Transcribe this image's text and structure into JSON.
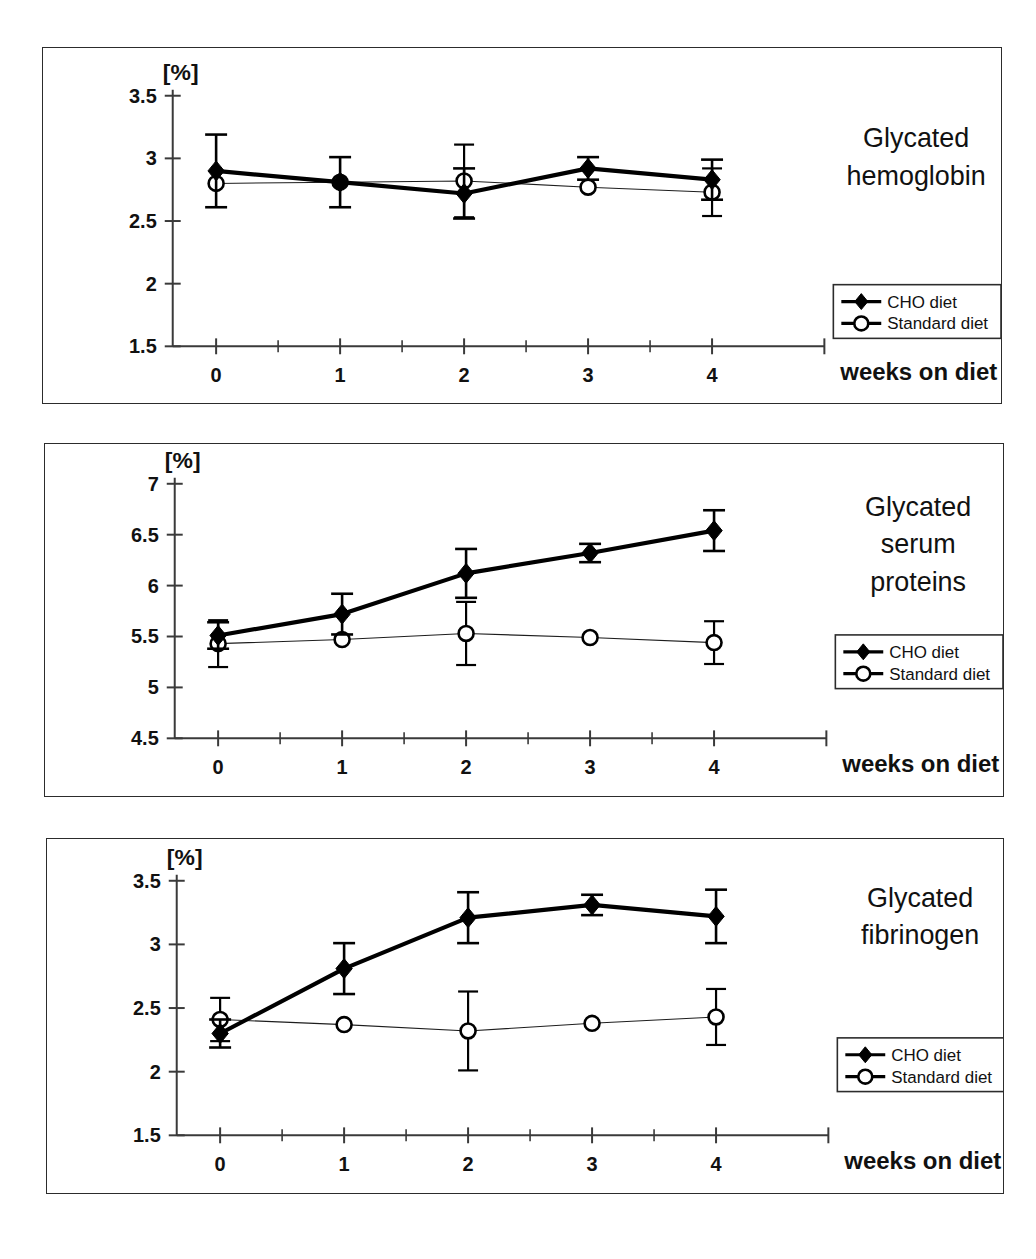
{
  "figure": {
    "panel_count": 3,
    "x_axis_name": "weeks on diet",
    "unit_label": "[%]",
    "legend": {
      "cho": "CHO diet",
      "standard": "Standard diet"
    },
    "colors": {
      "cho_line": "#000000",
      "standard_line": "#1d1d1d",
      "frame": "#2c2c2c",
      "background": "#ffffff"
    }
  },
  "chart_data": [
    {
      "type": "line",
      "title": "Glycated hemoglobin",
      "title_lines": [
        "Glycated",
        "hemoglobin"
      ],
      "xlabel": "weeks on diet",
      "ylabel": "[%]",
      "xlim": [
        -0.35,
        4.6
      ],
      "ylim": [
        1.5,
        3.5
      ],
      "xticks": [
        0,
        1,
        2,
        3,
        4
      ],
      "xtick_labels": [
        "0",
        "1",
        "2",
        "3",
        "4"
      ],
      "xticks_minor": [
        0.5,
        1.5,
        2.5,
        3.5
      ],
      "yticks": [
        1.5,
        2,
        2.5,
        3,
        3.5
      ],
      "ytick_labels": [
        "1.5",
        "2",
        "2.5",
        "3",
        "3.5"
      ],
      "grid": false,
      "legend_position": "right-middle",
      "x": [
        0,
        1,
        2,
        3,
        4
      ],
      "series": [
        {
          "name": "CHO diet",
          "marker": "filled-diamond",
          "values": [
            2.9,
            2.81,
            2.72,
            2.92,
            2.83
          ],
          "errors": [
            0.29,
            0.2,
            0.2,
            0.09,
            0.16
          ]
        },
        {
          "name": "Standard diet",
          "marker": "open-circle",
          "values": [
            2.8,
            2.81,
            2.82,
            2.77,
            2.73
          ],
          "errors": [
            0.0,
            0.0,
            0.29,
            0.0,
            0.19
          ]
        }
      ]
    },
    {
      "type": "line",
      "title": "Glycated serum proteins",
      "title_lines": [
        "Glycated",
        "serum",
        "proteins"
      ],
      "xlabel": "weeks on diet",
      "ylabel": "[%]",
      "xlim": [
        -0.35,
        4.6
      ],
      "ylim": [
        4.5,
        7
      ],
      "xticks": [
        0,
        1,
        2,
        3,
        4
      ],
      "xtick_labels": [
        "0",
        "1",
        "2",
        "3",
        "4"
      ],
      "xticks_minor": [
        0.5,
        1.5,
        2.5,
        3.5
      ],
      "yticks": [
        4.5,
        5,
        5.5,
        6,
        6.5,
        7
      ],
      "ytick_labels": [
        "4.5",
        "5",
        "5.5",
        "6",
        "6.5",
        "7"
      ],
      "grid": false,
      "legend_position": "right-middle",
      "x": [
        0,
        1,
        2,
        3,
        4
      ],
      "series": [
        {
          "name": "CHO diet",
          "marker": "filled-diamond",
          "values": [
            5.51,
            5.72,
            6.12,
            6.32,
            6.54
          ],
          "errors": [
            0.13,
            0.2,
            0.24,
            0.09,
            0.2
          ]
        },
        {
          "name": "Standard diet",
          "marker": "open-circle",
          "values": [
            5.43,
            5.47,
            5.53,
            5.49,
            5.44
          ],
          "errors": [
            0.23,
            0.0,
            0.31,
            0.0,
            0.21
          ]
        }
      ]
    },
    {
      "type": "line",
      "title": "Glycated fibrinogen",
      "title_lines": [
        "Glycated",
        "fibrinogen"
      ],
      "xlabel": "weeks on diet",
      "ylabel": "[%]",
      "xlim": [
        -0.35,
        4.6
      ],
      "ylim": [
        1.5,
        3.5
      ],
      "xticks": [
        0,
        1,
        2,
        3,
        4
      ],
      "xtick_labels": [
        "0",
        "1",
        "2",
        "3",
        "4"
      ],
      "xticks_minor": [
        0.5,
        1.5,
        2.5,
        3.5
      ],
      "yticks": [
        1.5,
        2,
        2.5,
        3,
        3.5
      ],
      "ytick_labels": [
        "1.5",
        "2",
        "2.5",
        "3",
        "3.5"
      ],
      "grid": false,
      "legend_position": "right-middle",
      "x": [
        0,
        1,
        2,
        3,
        4
      ],
      "series": [
        {
          "name": "CHO diet",
          "marker": "filled-diamond",
          "values": [
            2.3,
            2.81,
            3.21,
            3.31,
            3.22
          ],
          "errors": [
            0.11,
            0.2,
            0.2,
            0.08,
            0.21
          ]
        },
        {
          "name": "Standard diet",
          "marker": "open-circle",
          "values": [
            2.41,
            2.37,
            2.32,
            2.38,
            2.43
          ],
          "errors": [
            0.17,
            0.0,
            0.31,
            0.0,
            0.22
          ]
        }
      ]
    }
  ]
}
